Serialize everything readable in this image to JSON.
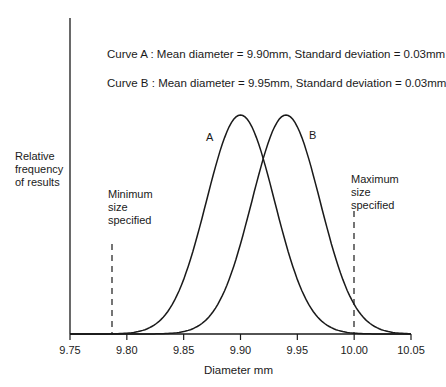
{
  "chart_data": {
    "type": "line",
    "title": "",
    "xlabel": "Diameter mm",
    "ylabel": "Relative frequency of results",
    "x_ticks": [
      "9.75",
      "9.80",
      "9.85",
      "9.90",
      "9.95",
      "10.00",
      "10.05"
    ],
    "xlim": [
      9.75,
      10.05
    ],
    "grid": false,
    "series": [
      {
        "name": "A",
        "distribution": "normal",
        "mean": 9.9,
        "std": 0.03
      },
      {
        "name": "B",
        "distribution": "normal",
        "mean": 9.95,
        "std": 0.03
      }
    ],
    "annotations": [
      {
        "text": "Curve A : Mean diameter = 9.90mm, Standard deviation = 0.03mm"
      },
      {
        "text": "Curve B : Mean diameter = 9.95mm, Standard deviation = 0.03mm"
      },
      {
        "text": "Minimum size specified",
        "x": 9.787,
        "style": "dashed vertical line"
      },
      {
        "text": "Maximum size specified",
        "x": 10.0,
        "style": "dashed vertical line"
      }
    ]
  },
  "labels": {
    "ylabel_lines": [
      "Relative",
      "frequency",
      "of results"
    ],
    "min_lines": [
      "Minimum",
      "size",
      "specified"
    ],
    "max_lines": [
      "Maximum",
      "size",
      "specified"
    ],
    "curve_a": "A",
    "curve_b": "B",
    "note_a": "Curve A : Mean diameter = 9.90mm, Standard deviation = 0.03mm",
    "note_b": "Curve B : Mean diameter = 9.95mm, Standard deviation = 0.03mm",
    "xlabel": "Diameter mm"
  }
}
